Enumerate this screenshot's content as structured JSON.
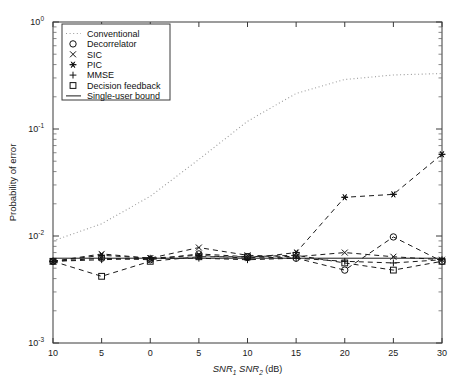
{
  "chart_data": {
    "type": "line",
    "title": "",
    "xlabel": "SNR1 SNR2 (dB)",
    "xlabel_parts": {
      "a": "SNR",
      "a_sub": "1",
      "b": "SNR",
      "b_sub": "2",
      "unit": "(dB)"
    },
    "ylabel": "Probability of error",
    "x": [
      -10,
      -5,
      0,
      5,
      10,
      15,
      20,
      25,
      30
    ],
    "xtick_labels": [
      "10",
      "5",
      "0",
      "5",
      "10",
      "15",
      "20",
      "25",
      "30"
    ],
    "xlim": [
      -10,
      30
    ],
    "ylim": [
      0.001,
      1
    ],
    "yscale": "log",
    "ytick_labels": [
      "10^0",
      "10^-1",
      "10^-2",
      "10^-3"
    ],
    "ytick_values": [
      1,
      0.1,
      0.01,
      0.001
    ],
    "grid": false,
    "legend_position": "upper-left-inside",
    "series": [
      {
        "name": "Conventional",
        "marker": "none",
        "style": "dotted",
        "values": [
          0.009,
          0.013,
          0.0235,
          0.052,
          0.118,
          0.215,
          0.29,
          0.32,
          0.33
        ]
      },
      {
        "name": "Decorrelator",
        "marker": "circle",
        "style": "dashed",
        "values": [
          0.0058,
          0.0062,
          0.006,
          0.0068,
          0.0064,
          0.0062,
          0.0048,
          0.0098,
          0.0058
        ]
      },
      {
        "name": "SIC",
        "marker": "x",
        "style": "dashed",
        "values": [
          0.0058,
          0.0068,
          0.0062,
          0.0078,
          0.0066,
          0.0064,
          0.007,
          0.0064,
          0.006
        ]
      },
      {
        "name": "PIC",
        "marker": "star",
        "style": "dashed",
        "values": [
          0.0058,
          0.0066,
          0.0062,
          0.0066,
          0.0062,
          0.007,
          0.023,
          0.0245,
          0.058
        ]
      },
      {
        "name": "MMSE",
        "marker": "plus",
        "style": "dashed",
        "values": [
          0.0058,
          0.006,
          0.0062,
          0.0062,
          0.006,
          0.0062,
          0.0058,
          0.0056,
          0.006
        ]
      },
      {
        "name": "Decision feedback",
        "marker": "square",
        "style": "dashed",
        "values": [
          0.0058,
          0.0042,
          0.0058,
          0.0064,
          0.0064,
          0.0066,
          0.0056,
          0.0048,
          0.0058
        ]
      },
      {
        "name": "Single-user bound",
        "marker": "none",
        "style": "solid",
        "values": [
          0.0062,
          0.0062,
          0.0062,
          0.0062,
          0.0062,
          0.0062,
          0.0062,
          0.0062,
          0.0062
        ]
      }
    ]
  },
  "legend": {
    "items": [
      {
        "label": "Conventional"
      },
      {
        "label": "Decorrelator"
      },
      {
        "label": "SIC"
      },
      {
        "label": "PIC"
      },
      {
        "label": "MMSE"
      },
      {
        "label": "Decision feedback"
      },
      {
        "label": "Single-user bound"
      }
    ]
  }
}
